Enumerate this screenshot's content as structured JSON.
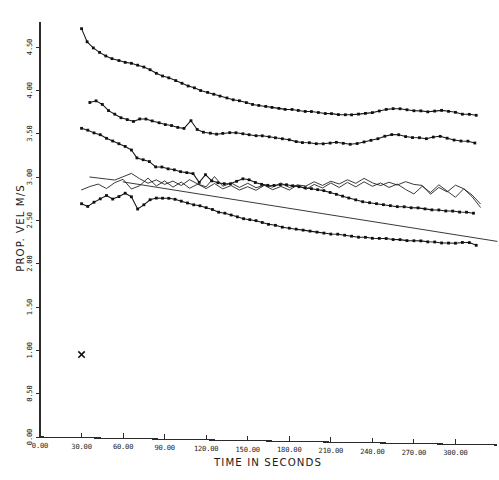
{
  "chart_data": {
    "type": "line",
    "title": "",
    "xlabel": "TIME IN SECONDS",
    "ylabel": "PROP. VEL M/S",
    "xlim": [
      0,
      330
    ],
    "ylim": [
      0,
      4.75
    ],
    "grid": false,
    "legend": "none",
    "xticks": [
      "0.00",
      "30.00",
      "60.00",
      "90.00",
      "120.00",
      "150.00",
      "180.00",
      "210.00",
      "240.00",
      "270.00",
      "300.00"
    ],
    "xtick_values": [
      0,
      30,
      60,
      90,
      120,
      150,
      180,
      210,
      240,
      270,
      300
    ],
    "yticks": [
      "0.00",
      "0.50",
      "1.00",
      "1.50",
      "2.00",
      "2.50",
      "3.00",
      "3.50",
      "4.00",
      "4.50"
    ],
    "ytick_values": [
      0,
      0.5,
      1.0,
      1.5,
      2.0,
      2.5,
      3.0,
      3.5,
      4.0,
      4.5
    ],
    "series": [
      {
        "name": "run-1-upper",
        "marker": "dot",
        "x": [
          30.0,
          34.0,
          38.5,
          43.0,
          47.5,
          52.0,
          57.0,
          61.5,
          66.0,
          70.5,
          75.0,
          79.5,
          84.0,
          88.5,
          93.0,
          98.0,
          102.5,
          107.0,
          111.5,
          116.0,
          121.0,
          125.5,
          130.0,
          135.0,
          139.5,
          144.0,
          149.0,
          153.5,
          158.0,
          163.0,
          167.5,
          172.5,
          177.0,
          182.0,
          186.5,
          191.5,
          196.0,
          201.0,
          206.0,
          210.5,
          215.5,
          220.5,
          225.0,
          230.0,
          235.0,
          240.0,
          245.0,
          250.0,
          255.0,
          260.0,
          265.0,
          270.0,
          275.0,
          280.0,
          285.0,
          290.0,
          295.0,
          300.0,
          305.0,
          310.0,
          315.0
        ],
        "y": [
          4.72,
          4.57,
          4.5,
          4.45,
          4.41,
          4.38,
          4.36,
          4.34,
          4.33,
          4.31,
          4.29,
          4.26,
          4.22,
          4.19,
          4.17,
          4.14,
          4.11,
          4.08,
          4.06,
          4.03,
          4.01,
          3.99,
          3.97,
          3.95,
          3.93,
          3.92,
          3.9,
          3.88,
          3.87,
          3.86,
          3.85,
          3.84,
          3.83,
          3.83,
          3.82,
          3.81,
          3.81,
          3.8,
          3.79,
          3.79,
          3.78,
          3.78,
          3.78,
          3.79,
          3.8,
          3.81,
          3.83,
          3.85,
          3.86,
          3.86,
          3.85,
          3.84,
          3.84,
          3.83,
          3.84,
          3.85,
          3.84,
          3.83,
          3.81,
          3.81,
          3.8
        ]
      },
      {
        "name": "run-2-mid-upper",
        "marker": "dot",
        "x": [
          36.0,
          40.5,
          45.0,
          49.5,
          54.0,
          58.5,
          63.0,
          67.5,
          72.0,
          76.5,
          81.0,
          86.0,
          90.5,
          95.0,
          99.5,
          104.0,
          109.0,
          113.5,
          118.0,
          123.0,
          127.5,
          132.0,
          137.0,
          141.5,
          146.5,
          151.0,
          156.0,
          160.5,
          165.5,
          170.0,
          175.0,
          180.0,
          185.0,
          189.5,
          194.5,
          199.5,
          204.5,
          209.5,
          214.0,
          219.0,
          224.0,
          229.0,
          234.0,
          239.0,
          244.0,
          249.0,
          254.0,
          259.0,
          264.0,
          269.0,
          274.0,
          279.0,
          284.0,
          289.0,
          294.0,
          299.0,
          304.0,
          309.0,
          314.0
        ],
        "y": [
          3.87,
          3.89,
          3.85,
          3.78,
          3.74,
          3.7,
          3.68,
          3.66,
          3.69,
          3.69,
          3.67,
          3.65,
          3.63,
          3.62,
          3.6,
          3.59,
          3.68,
          3.58,
          3.55,
          3.54,
          3.53,
          3.54,
          3.55,
          3.55,
          3.54,
          3.53,
          3.52,
          3.52,
          3.51,
          3.5,
          3.49,
          3.48,
          3.46,
          3.45,
          3.45,
          3.44,
          3.44,
          3.45,
          3.46,
          3.45,
          3.44,
          3.45,
          3.47,
          3.49,
          3.51,
          3.54,
          3.56,
          3.56,
          3.54,
          3.53,
          3.53,
          3.52,
          3.54,
          3.55,
          3.53,
          3.51,
          3.5,
          3.5,
          3.48
        ]
      },
      {
        "name": "run-3-mid",
        "marker": "dot",
        "x": [
          30.0,
          34.5,
          39.0,
          43.5,
          48.0,
          52.5,
          57.0,
          61.5,
          66.0,
          70.0,
          74.5,
          79.0,
          83.5,
          88.0,
          92.5,
          97.0,
          101.5,
          106.0,
          110.5,
          115.0,
          119.5,
          124.0,
          128.5,
          133.0,
          137.5,
          142.0,
          146.5,
          151.0,
          155.5,
          160.0,
          164.5,
          169.0,
          173.5,
          178.0,
          182.5,
          187.0,
          191.5,
          196.0,
          200.5,
          205.0,
          209.5,
          214.0,
          218.5,
          223.0,
          228.0,
          233.0,
          238.0,
          243.0,
          248.0,
          253.0,
          258.0,
          263.0,
          268.0,
          273.0,
          278.0,
          283.0,
          288.0,
          293.0,
          298.0,
          303.0,
          308.0,
          313.0
        ],
        "y": [
          3.57,
          3.55,
          3.52,
          3.5,
          3.46,
          3.43,
          3.4,
          3.37,
          3.33,
          3.24,
          3.22,
          3.2,
          3.14,
          3.14,
          3.12,
          3.11,
          3.09,
          3.08,
          3.07,
          2.97,
          3.06,
          2.99,
          2.97,
          2.96,
          2.96,
          2.99,
          3.02,
          3.01,
          2.98,
          2.96,
          2.95,
          2.95,
          2.96,
          2.96,
          2.95,
          2.94,
          2.93,
          2.92,
          2.91,
          2.9,
          2.88,
          2.86,
          2.84,
          2.82,
          2.8,
          2.78,
          2.77,
          2.76,
          2.75,
          2.74,
          2.73,
          2.73,
          2.72,
          2.72,
          2.71,
          2.7,
          2.7,
          2.69,
          2.69,
          2.68,
          2.68,
          2.67
        ]
      },
      {
        "name": "run-4-lower",
        "marker": "dot",
        "x": [
          30.0,
          34.5,
          39.0,
          43.5,
          48.0,
          52.5,
          57.0,
          61.5,
          66.0,
          70.5,
          75.0,
          79.5,
          84.0,
          88.5,
          93.0,
          97.5,
          102.0,
          106.5,
          111.0,
          115.5,
          120.0,
          124.5,
          129.0,
          133.5,
          138.0,
          142.5,
          147.0,
          151.5,
          156.0,
          160.5,
          165.0,
          170.0,
          175.0,
          180.0,
          185.0,
          190.0,
          195.0,
          200.0,
          205.0,
          210.0,
          215.0,
          220.0,
          225.0,
          230.0,
          235.0,
          240.0,
          245.0,
          250.0,
          255.0,
          260.0,
          265.0,
          270.0,
          275.0,
          280.0,
          285.0,
          290.0,
          295.0,
          300.0,
          305.0,
          310.0,
          315.0
        ],
        "y": [
          2.7,
          2.67,
          2.72,
          2.76,
          2.8,
          2.76,
          2.79,
          2.83,
          2.79,
          2.65,
          2.7,
          2.76,
          2.78,
          2.78,
          2.78,
          2.77,
          2.75,
          2.73,
          2.71,
          2.7,
          2.68,
          2.66,
          2.63,
          2.62,
          2.6,
          2.58,
          2.56,
          2.55,
          2.54,
          2.52,
          2.5,
          2.49,
          2.47,
          2.46,
          2.45,
          2.44,
          2.43,
          2.42,
          2.41,
          2.4,
          2.4,
          2.39,
          2.38,
          2.37,
          2.37,
          2.36,
          2.36,
          2.36,
          2.35,
          2.35,
          2.34,
          2.34,
          2.34,
          2.33,
          2.33,
          2.32,
          2.32,
          2.32,
          2.33,
          2.33,
          2.3
        ]
      },
      {
        "name": "trace-noisy-a",
        "marker": "none",
        "x": [
          36.0,
          42.0,
          48.0,
          54.0,
          60.0,
          66.0,
          72.0,
          78.0,
          84.0,
          90.0,
          96.0,
          102.0,
          108.0,
          114.0,
          120.0,
          126.0,
          132.0,
          138.0,
          144.0,
          150.0,
          156.0,
          162.0,
          168.0,
          174.0,
          180.0,
          186.0,
          192.0,
          198.0,
          204.0,
          210.0,
          216.0,
          222.0,
          228.0,
          234.0,
          240.0,
          246.0,
          252.0,
          258.0,
          264.0,
          270.0,
          276.0,
          282.0,
          288.0,
          294.0,
          300.0,
          306.0,
          312.0,
          318.0
        ],
        "y": [
          3.01,
          3.0,
          2.99,
          2.98,
          3.02,
          3.06,
          3.0,
          2.95,
          2.99,
          2.94,
          2.98,
          2.93,
          3.0,
          2.95,
          2.92,
          3.04,
          2.93,
          2.97,
          2.92,
          2.97,
          2.92,
          2.95,
          2.93,
          2.98,
          2.93,
          2.96,
          2.95,
          3.0,
          2.96,
          3.01,
          2.98,
          3.03,
          2.99,
          3.05,
          3.0,
          2.97,
          3.01,
          2.98,
          3.02,
          2.99,
          2.98,
          2.88,
          2.96,
          2.91,
          2.99,
          2.95,
          2.86,
          2.74
        ]
      },
      {
        "name": "trace-noisy-b",
        "marker": "none",
        "x": [
          30.0,
          36.0,
          42.0,
          48.0,
          54.0,
          60.0,
          66.0,
          72.0,
          78.0,
          84.0,
          90.0,
          96.0,
          102.0,
          108.0,
          114.0,
          120.0,
          126.0,
          132.0,
          138.0,
          144.0,
          150.0,
          156.0,
          162.0,
          168.0,
          174.0,
          180.0,
          186.0,
          192.0,
          198.0,
          204.0,
          210.0,
          216.0,
          222.0,
          228.0,
          234.0,
          240.0,
          246.0,
          252.0,
          258.0,
          264.0,
          270.0,
          276.0,
          282.0,
          288.0,
          294.0,
          300.0,
          306.0,
          312.0,
          318.0
        ],
        "y": [
          2.86,
          2.9,
          2.93,
          2.88,
          2.95,
          2.99,
          2.88,
          2.92,
          3.01,
          2.92,
          2.98,
          2.91,
          2.97,
          2.9,
          2.95,
          2.9,
          2.96,
          2.9,
          2.94,
          2.89,
          2.93,
          2.89,
          2.95,
          2.9,
          2.94,
          2.9,
          2.96,
          2.91,
          2.97,
          2.93,
          2.99,
          2.94,
          3.0,
          2.95,
          3.01,
          2.96,
          3.0,
          2.95,
          2.99,
          2.93,
          2.88,
          2.97,
          2.9,
          2.99,
          2.92,
          2.85,
          2.95,
          2.88,
          2.78
        ]
      },
      {
        "name": "trend-straight",
        "marker": "none",
        "x": [
          60.0,
          330.0
        ],
        "y": [
          2.96,
          2.35
        ]
      }
    ],
    "point_markers": [
      {
        "name": "outlier-x",
        "symbol": "x",
        "x": 30.0,
        "y": 0.96
      }
    ]
  },
  "axes": {
    "x_axis_label": "TIME IN SECONDS",
    "y_axis_label": "PROP. VEL M/S"
  }
}
